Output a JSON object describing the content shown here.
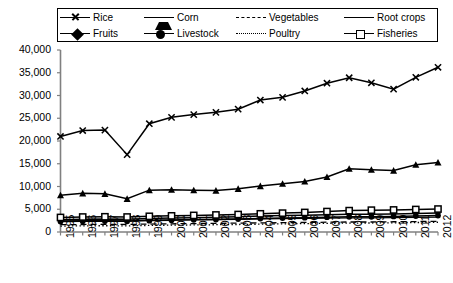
{
  "chart_data": {
    "type": "line",
    "title": "",
    "xlabel": "",
    "ylabel": "",
    "ylim": [
      0,
      40000
    ],
    "ytick_step": 5000,
    "ytick_labels": [
      "40,000",
      "35,000",
      "30,000",
      "25,000",
      "20,000",
      "15,000",
      "10,000",
      "5,000",
      "0"
    ],
    "ytick_values": [
      40000,
      35000,
      30000,
      25000,
      20000,
      15000,
      10000,
      5000,
      0
    ],
    "grid": false,
    "legend_position": "top",
    "categories": [
      1995,
      1996,
      1997,
      1998,
      1999,
      2000,
      2001,
      2002,
      2003,
      2004,
      2005,
      2006,
      2007,
      2008,
      2009,
      2010,
      2011,
      2012
    ],
    "xtick_labels": [
      "1995",
      "1996",
      "1997",
      "1998",
      "1999",
      "2000",
      "2001",
      "2002",
      "2003",
      "2004",
      "2005",
      "2006",
      "2007",
      "2008",
      "2009",
      "2010",
      "2011",
      "2012"
    ],
    "series": [
      {
        "name": "Rice",
        "marker": "x",
        "line": "solid",
        "values": [
          21000,
          22300,
          22400,
          17000,
          23800,
          25200,
          25800,
          26300,
          27000,
          29000,
          29600,
          31000,
          32700,
          33900,
          32800,
          31400,
          34000,
          36200
        ]
      },
      {
        "name": "Corn",
        "marker": "triangle",
        "line": "solid",
        "values": [
          8100,
          8500,
          8400,
          7300,
          9200,
          9300,
          9200,
          9100,
          9500,
          10100,
          10600,
          11100,
          12100,
          13900,
          13700,
          13500,
          14800,
          15300
        ]
      },
      {
        "name": "Vegetables",
        "marker": "none",
        "line": "dashed",
        "values": [
          1600,
          1650,
          1700,
          1650,
          1750,
          1800,
          1850,
          1900,
          1950,
          2000,
          2050,
          2100,
          2150,
          2200,
          2200,
          2250,
          2300,
          2350
        ]
      },
      {
        "name": "Root crops",
        "marker": "none",
        "line": "solid",
        "values": [
          2450,
          2500,
          2520,
          2450,
          2600,
          2650,
          2700,
          2750,
          2800,
          2900,
          2950,
          3000,
          3050,
          3100,
          3100,
          3150,
          3200,
          3250
        ]
      },
      {
        "name": "Fruits",
        "marker": "diamond",
        "line": "solid",
        "values": [
          2700,
          2800,
          2850,
          2780,
          2950,
          3050,
          3150,
          3250,
          3350,
          3500,
          3600,
          3700,
          3800,
          3900,
          3900,
          3950,
          4050,
          4150
        ]
      },
      {
        "name": "Livestock",
        "marker": "circle",
        "line": "solid",
        "values": [
          2300,
          2380,
          2420,
          2350,
          2500,
          2600,
          2680,
          2750,
          2830,
          2950,
          3050,
          3150,
          3250,
          3350,
          3350,
          3420,
          3520,
          3620
        ]
      },
      {
        "name": "Poultry",
        "marker": "none",
        "line": "dotted",
        "values": [
          1300,
          1350,
          1380,
          1350,
          1450,
          1500,
          1550,
          1600,
          1650,
          1720,
          1780,
          1840,
          1900,
          1960,
          1980,
          2020,
          2080,
          2140
        ]
      },
      {
        "name": "Fisheries",
        "marker": "square",
        "line": "solid",
        "values": [
          3200,
          3300,
          3350,
          3300,
          3450,
          3550,
          3650,
          3750,
          3850,
          4000,
          4150,
          4300,
          4500,
          4700,
          4800,
          4850,
          4950,
          5050
        ]
      }
    ]
  },
  "legend": {
    "items": [
      {
        "label": "Rice",
        "marker": "x",
        "line": "solid"
      },
      {
        "label": "Corn",
        "marker": "triangle",
        "line": "solid"
      },
      {
        "label": "Vegetables",
        "marker": "none",
        "line": "dashed"
      },
      {
        "label": "Root crops",
        "marker": "none",
        "line": "solid"
      },
      {
        "label": "Fruits",
        "marker": "diamond",
        "line": "solid"
      },
      {
        "label": "Livestock",
        "marker": "circle",
        "line": "solid"
      },
      {
        "label": "Poultry",
        "marker": "none",
        "line": "dotted"
      },
      {
        "label": "Fisheries",
        "marker": "square",
        "line": "solid"
      }
    ]
  },
  "colors": {
    "axis": "#000000",
    "line": "#000000",
    "background": "#ffffff"
  }
}
